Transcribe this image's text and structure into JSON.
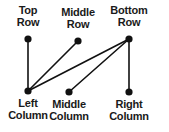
{
  "diagram": {
    "colors": {
      "background": "#ffffff",
      "node": "#111111",
      "edge": "#111111",
      "text": "#1a1a1a"
    },
    "style": {
      "node_radius": 3.6,
      "edge_width": 1.6
    },
    "nodes": [
      {
        "id": "top-row",
        "label_line1": "Top",
        "label_line2": "Row",
        "label_full": "Top Row",
        "x": 28,
        "y": 39,
        "label_position": "above"
      },
      {
        "id": "middle-row",
        "label_line1": "Middle",
        "label_line2": "Row",
        "label_full": "Middle Row",
        "x": 78,
        "y": 41,
        "label_position": "above"
      },
      {
        "id": "bottom-row",
        "label_line1": "Bottom",
        "label_line2": "Row",
        "label_full": "Bottom Row",
        "x": 129,
        "y": 39,
        "label_position": "above"
      },
      {
        "id": "left-column",
        "label_line1": "Left",
        "label_line2": "Column",
        "label_full": "Left Column",
        "x": 28,
        "y": 91,
        "label_position": "below"
      },
      {
        "id": "middle-column",
        "label_line1": "Middle",
        "label_line2": "Column",
        "label_full": "Middle Column",
        "x": 69,
        "y": 92,
        "label_position": "below"
      },
      {
        "id": "right-column",
        "label_line1": "Right",
        "label_line2": "Column",
        "label_full": "Right Column",
        "x": 129,
        "y": 92,
        "label_position": "below"
      }
    ],
    "edges": [
      {
        "id": "edge-top-row-left-column",
        "from": "top-row",
        "to": "left-column",
        "x1": 28,
        "y1": 39,
        "x2": 28,
        "y2": 91
      },
      {
        "id": "edge-middle-row-left-column",
        "from": "middle-row",
        "to": "left-column",
        "x1": 78,
        "y1": 41,
        "x2": 28,
        "y2": 91
      },
      {
        "id": "edge-bottom-row-left-column",
        "from": "bottom-row",
        "to": "left-column",
        "x1": 129,
        "y1": 39,
        "x2": 28,
        "y2": 91
      },
      {
        "id": "edge-bottom-row-middle-column",
        "from": "bottom-row",
        "to": "middle-column",
        "x1": 129,
        "y1": 39,
        "x2": 69,
        "y2": 92
      },
      {
        "id": "edge-bottom-row-right-column",
        "from": "bottom-row",
        "to": "right-column",
        "x1": 129,
        "y1": 39,
        "x2": 129,
        "y2": 92
      }
    ]
  }
}
